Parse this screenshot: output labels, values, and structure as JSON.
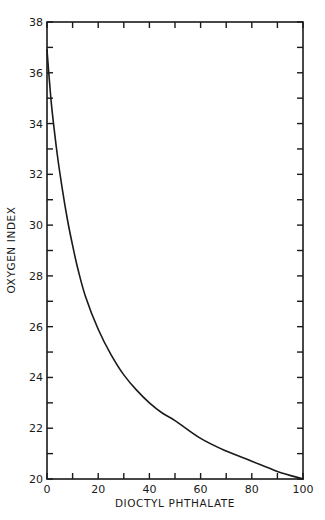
{
  "chart_data": {
    "type": "line",
    "title": "",
    "xlabel": "DIOCTYL PHTHALATE",
    "ylabel": "OXYGEN INDEX",
    "xlim": [
      0,
      100
    ],
    "ylim": [
      20,
      38
    ],
    "x_ticks": [
      0,
      20,
      40,
      60,
      80,
      100
    ],
    "x_minor_ticks": [
      10,
      30,
      50,
      70,
      90
    ],
    "y_ticks": [
      20,
      22,
      24,
      26,
      28,
      30,
      32,
      34,
      36,
      38
    ],
    "y_minor_ticks": [
      21,
      23,
      25,
      27,
      29,
      31,
      33,
      35,
      37
    ],
    "grid": false,
    "legend": null,
    "series": [
      {
        "name": "Oxygen index vs dioctyl phthalate",
        "x": [
          0,
          1,
          2,
          4,
          6,
          8,
          10,
          12,
          15,
          20,
          25,
          30,
          35,
          40,
          45,
          50,
          60,
          70,
          80,
          90,
          100
        ],
        "y": [
          36.9,
          35.6,
          34.5,
          32.8,
          31.4,
          30.2,
          29.2,
          28.3,
          27.2,
          25.9,
          24.9,
          24.1,
          23.5,
          23.0,
          22.6,
          22.3,
          21.6,
          21.1,
          20.7,
          20.3,
          20.0
        ]
      }
    ]
  }
}
